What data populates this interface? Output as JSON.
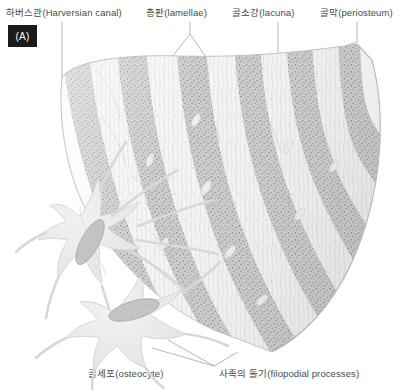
{
  "figure": {
    "panel_tag": "(A)",
    "background_color": "#ffffff",
    "text_color": "#4a4a4a",
    "leader_color": "#9a9a9a"
  },
  "labels": {
    "haversian_canal": "하버스관(Harversian canal)",
    "lamellae": "층판(lamellae)",
    "lacuna": "골소강(lacuna)",
    "periosteum": "골막(periosteum)",
    "osteocyte": "골세포(osteocyte)",
    "filopodial_processes": "사족의 돌기(filopodial processes)"
  },
  "palette": {
    "band_dark": "#c9c9c9",
    "band_light": "#f3f3f3",
    "stipple": "#6e6e6e",
    "cell_body": "#eaeaea",
    "cell_outline": "#d2d2d2",
    "nucleus": "#c2c2c2",
    "nucleus_outline": "#a8a8a8"
  },
  "structure": {
    "lamellae_band_count": 11,
    "osteocyte_count": 2,
    "orientation": "fan-wedge, inner canal at left, periosteum at right"
  }
}
